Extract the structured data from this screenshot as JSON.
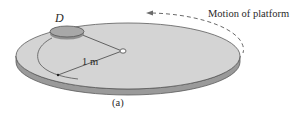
{
  "figure": {
    "disk_label": "D",
    "radius_label": "1 m",
    "motion_label": "Motion of platform",
    "caption": "(a)"
  },
  "colors": {
    "background": "#ffffff",
    "platform_top": "#d4d4d4",
    "platform_side": "#9a9a9a",
    "platform_outline": "#5a5a5a",
    "disk_fill": "#a8a8a8",
    "line": "#444444",
    "dashed_arrow": "#6a6a6a",
    "text": "#2a2a2a"
  },
  "icons": {
    "motion_arrow": "dashed-curved-arrow-left",
    "pivot": "small-circle-pivot"
  }
}
